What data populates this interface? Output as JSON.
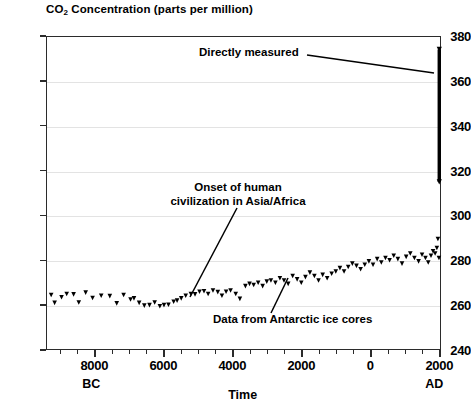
{
  "chart_data": {
    "type": "scatter",
    "title": "CO2  Concentration (parts per million)",
    "title_main": "CO",
    "title_sub": "2",
    "title_rest": "  Concentration (parts per million)",
    "xlabel": "Time",
    "ylabel": "",
    "xlim": [
      -9400,
      2050
    ],
    "ylim": [
      240,
      380
    ],
    "grid": true,
    "legend": "none",
    "y_ticks": [
      240,
      260,
      280,
      300,
      320,
      340,
      360,
      380
    ],
    "x_ticks": [
      -8000,
      -6000,
      -4000,
      -2000,
      0,
      2000
    ],
    "x_tick_labels": [
      "8000",
      "6000",
      "4000",
      "2000",
      "0",
      "2000"
    ],
    "x_minor_step": 500,
    "era_left": "BC",
    "era_right": "AD",
    "annotations": [
      {
        "id": "directly-measured",
        "text": "Directly measured"
      },
      {
        "id": "onset-civilization",
        "line1": "Onset of human",
        "line2": "civilization in Asia/Africa"
      },
      {
        "id": "ice-cores",
        "text": "Data from Antarctic ice cores"
      }
    ],
    "series": [
      {
        "name": "Antarctic ice core CO2",
        "marker": "triangle-down",
        "color": "#000000",
        "points": [
          [
            -9250,
            264.5
          ],
          [
            -9150,
            261.0
          ],
          [
            -8950,
            263.5
          ],
          [
            -8800,
            265.0
          ],
          [
            -8600,
            264.8
          ],
          [
            -8450,
            261.2
          ],
          [
            -8250,
            265.6
          ],
          [
            -8050,
            263.2
          ],
          [
            -7800,
            264.2
          ],
          [
            -7550,
            264.0
          ],
          [
            -7350,
            260.8
          ],
          [
            -7150,
            264.5
          ],
          [
            -6950,
            262.5
          ],
          [
            -6850,
            263.0
          ],
          [
            -6700,
            261.0
          ],
          [
            -6550,
            259.8
          ],
          [
            -6400,
            260.0
          ],
          [
            -6250,
            261.2
          ],
          [
            -6100,
            259.5
          ],
          [
            -5980,
            260.0
          ],
          [
            -5850,
            260.2
          ],
          [
            -5700,
            261.5
          ],
          [
            -5600,
            262.0
          ],
          [
            -5480,
            263.0
          ],
          [
            -5350,
            264.2
          ],
          [
            -5200,
            265.0
          ],
          [
            -5080,
            264.8
          ],
          [
            -4950,
            266.0
          ],
          [
            -4820,
            266.2
          ],
          [
            -4700,
            265.0
          ],
          [
            -4560,
            266.5
          ],
          [
            -4420,
            265.8
          ],
          [
            -4300,
            264.2
          ],
          [
            -4180,
            266.0
          ],
          [
            -4050,
            266.5
          ],
          [
            -3900,
            265.0
          ],
          [
            -3780,
            262.8
          ],
          [
            -3620,
            268.5
          ],
          [
            -3500,
            269.5
          ],
          [
            -3380,
            269.0
          ],
          [
            -3250,
            270.0
          ],
          [
            -3120,
            268.5
          ],
          [
            -3000,
            270.5
          ],
          [
            -2880,
            271.0
          ],
          [
            -2750,
            270.0
          ],
          [
            -2620,
            272.0
          ],
          [
            -2500,
            271.0
          ],
          [
            -2380,
            269.5
          ],
          [
            -2250,
            273.0
          ],
          [
            -2120,
            271.5
          ],
          [
            -2000,
            270.0
          ],
          [
            -1880,
            272.5
          ],
          [
            -1750,
            274.5
          ],
          [
            -1620,
            273.0
          ],
          [
            -1500,
            271.0
          ],
          [
            -1380,
            273.5
          ],
          [
            -1250,
            272.0
          ],
          [
            -1120,
            274.0
          ],
          [
            -1000,
            275.0
          ],
          [
            -880,
            276.5
          ],
          [
            -760,
            275.0
          ],
          [
            -640,
            277.0
          ],
          [
            -520,
            278.5
          ],
          [
            -400,
            277.5
          ],
          [
            -280,
            276.0
          ],
          [
            -160,
            278.0
          ],
          [
            -40,
            279.5
          ],
          [
            80,
            278.0
          ],
          [
            200,
            280.5
          ],
          [
            320,
            279.0
          ],
          [
            440,
            281.0
          ],
          [
            560,
            280.0
          ],
          [
            680,
            282.0
          ],
          [
            800,
            280.5
          ],
          [
            920,
            278.5
          ],
          [
            1040,
            281.5
          ],
          [
            1160,
            283.0
          ],
          [
            1280,
            281.0
          ],
          [
            1400,
            279.5
          ],
          [
            1500,
            282.5
          ],
          [
            1600,
            281.0
          ],
          [
            1680,
            279.0
          ],
          [
            1760,
            282.0
          ],
          [
            1820,
            284.0
          ],
          [
            1880,
            283.0
          ],
          [
            1930,
            285.5
          ],
          [
            1960,
            289.5
          ],
          [
            1990,
            281.0
          ]
        ]
      },
      {
        "name": "Directly measured modern record",
        "marker": "vertical-bar",
        "color": "#000000",
        "x": 2000,
        "y_min": 315,
        "y_max": 374
      }
    ]
  }
}
